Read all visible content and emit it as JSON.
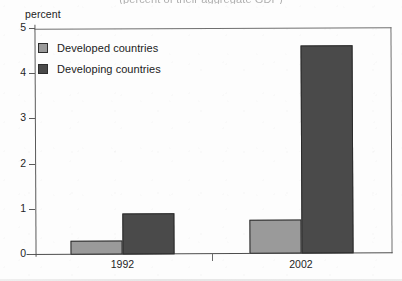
{
  "caption": "(percent of their aggregate GDP)",
  "axis_unit_label": "percent",
  "colors": {
    "developed": "#9a9a9a",
    "developing": "#4a4a4a",
    "axis": "#5a5a5a",
    "frame": "#6f6f6f",
    "text": "#1b1b1b"
  },
  "legend": {
    "items": [
      {
        "label": "Developed countries",
        "color": "#9a9a9a"
      },
      {
        "label": "Developing countries",
        "color": "#4a4a4a"
      }
    ]
  },
  "y_ticks": [
    {
      "label": "5",
      "value": 5
    },
    {
      "label": "4",
      "value": 4
    },
    {
      "label": "3",
      "value": 3
    },
    {
      "label": "2",
      "value": 2
    },
    {
      "label": "1",
      "value": 1
    },
    {
      "label": "0",
      "value": 0
    }
  ],
  "chart_data": {
    "type": "bar",
    "title": "(percent of their aggregate GDP)",
    "xlabel": "",
    "ylabel": "percent",
    "ylim": [
      0,
      5
    ],
    "ytick_step": 1,
    "grid": false,
    "legend_position": "upper-left-inside",
    "categories": [
      "1992",
      "2002"
    ],
    "series": [
      {
        "name": "Developed countries",
        "color": "#9a9a9a",
        "values": [
          0.3,
          0.75
        ]
      },
      {
        "name": "Developing countries",
        "color": "#4a4a4a",
        "values": [
          0.9,
          4.6
        ]
      }
    ]
  }
}
